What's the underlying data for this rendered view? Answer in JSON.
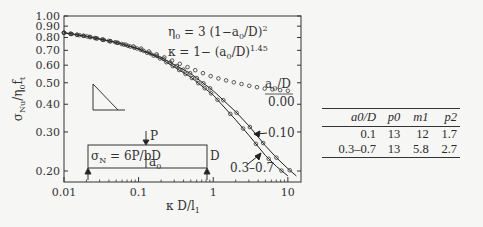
{
  "chart_data": {
    "type": "line",
    "title": "",
    "xlabel": "κ D/l₁",
    "ylabel": "σNu/η0 ft",
    "xscale": "log",
    "yscale": "log",
    "xlim": [
      0.01,
      15
    ],
    "ylim": [
      0.19,
      1.0
    ],
    "xticks": [
      "0.01",
      "0.1",
      "1",
      "10"
    ],
    "yticks": [
      "0.20",
      "0.30",
      "0.40",
      "0.50",
      "0.60",
      "0.70",
      "0.80",
      "0.90",
      "1.00"
    ],
    "annotations": {
      "eq1": "η0 = 3 (1−a0/D)²",
      "eq2": "κ = 1− (a0/D)^1.45",
      "legend_header": "a0/D",
      "label_000": "0.00",
      "label_010": "0.10",
      "label_0307": "0.3–0.7",
      "inset_formula": "σN = 6P/bD",
      "inset_P": "P",
      "inset_a0": "a0",
      "inset_D": "D"
    },
    "series": [
      {
        "name": "a0/D = 0.00 (data, open circles)",
        "style": "markers",
        "x": [
          0.01,
          0.02,
          0.05,
          0.1,
          0.2,
          0.5,
          1.0,
          2.0,
          3.0,
          5.0,
          7.0,
          10.0
        ],
        "y": [
          0.84,
          0.81,
          0.76,
          0.72,
          0.66,
          0.58,
          0.53,
          0.5,
          0.485,
          0.47,
          0.465,
          0.46
        ]
      },
      {
        "name": "a0/D = 0.10 (fit line + circles)",
        "style": "line+markers",
        "x": [
          0.01,
          0.02,
          0.05,
          0.1,
          0.2,
          0.5,
          1.0,
          2.0,
          3.0,
          5.0,
          7.0,
          10.0,
          13.0
        ],
        "y": [
          0.84,
          0.81,
          0.76,
          0.71,
          0.65,
          0.55,
          0.46,
          0.37,
          0.32,
          0.26,
          0.23,
          0.205,
          0.19
        ]
      },
      {
        "name": "a0/D = 0.3–0.7 (fit line + circles)",
        "style": "line+markers",
        "x": [
          0.01,
          0.02,
          0.05,
          0.1,
          0.2,
          0.5,
          1.0,
          2.0,
          3.0,
          5.0,
          7.0,
          10.0
        ],
        "y": [
          0.84,
          0.81,
          0.76,
          0.71,
          0.64,
          0.53,
          0.44,
          0.34,
          0.29,
          0.235,
          0.21,
          0.19
        ]
      }
    ]
  },
  "table": {
    "headers": [
      "a0/D",
      "p0",
      "m1",
      "p2"
    ],
    "rows": [
      [
        "0.1",
        "13",
        "12",
        "1.7"
      ],
      [
        "0.3–0.7",
        "13",
        "5.8",
        "2.7"
      ]
    ]
  }
}
